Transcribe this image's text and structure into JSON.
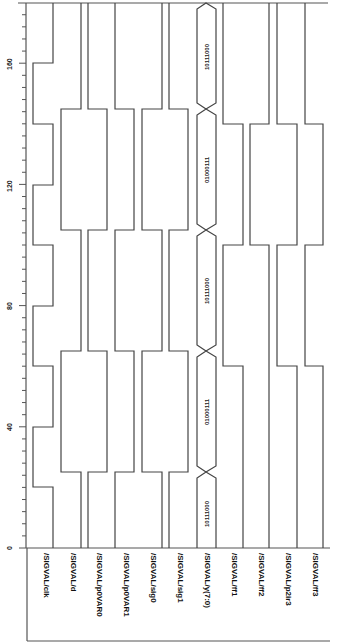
{
  "chart_data": {
    "type": "timing-diagram",
    "orientation": "rotated-90 (time runs bottom to top, signals left to right)",
    "time_axis": {
      "min": 0,
      "max": 180,
      "major_ticks": [
        0,
        40,
        80,
        120,
        160
      ],
      "minor_step": 4
    },
    "signals": [
      {
        "name": "/SIGVAL/clk",
        "type": "bit",
        "transitions": [
          [
            0,
            0
          ],
          [
            20,
            1
          ],
          [
            40,
            0
          ],
          [
            60,
            1
          ],
          [
            80,
            0
          ],
          [
            100,
            1
          ],
          [
            120,
            0
          ],
          [
            140,
            1
          ],
          [
            160,
            0
          ]
        ]
      },
      {
        "name": "/SIGVAL/d",
        "type": "bit",
        "transitions": [
          [
            0,
            0
          ],
          [
            25,
            1
          ],
          [
            65,
            0
          ],
          [
            105,
            1
          ],
          [
            145,
            0
          ]
        ]
      },
      {
        "name": "/SIGVAL/p0VAR0",
        "type": "bit",
        "transitions": [
          [
            0,
            0
          ],
          [
            25,
            1
          ],
          [
            65,
            0
          ],
          [
            105,
            1
          ],
          [
            145,
            0
          ]
        ]
      },
      {
        "name": "/SIGVAL/p0VAR1",
        "type": "bit",
        "transitions": [
          [
            0,
            0
          ],
          [
            25,
            1
          ],
          [
            65,
            0
          ],
          [
            105,
            1
          ],
          [
            145,
            0
          ]
        ]
      },
      {
        "name": "/SIGVAL/sig0",
        "type": "bit",
        "transitions": [
          [
            0,
            1
          ],
          [
            25,
            0
          ],
          [
            65,
            1
          ],
          [
            105,
            0
          ],
          [
            145,
            1
          ]
        ]
      },
      {
        "name": "/SIGVAL/sig1",
        "type": "bit",
        "transitions": [
          [
            0,
            0
          ],
          [
            25,
            1
          ],
          [
            65,
            0
          ],
          [
            105,
            1
          ],
          [
            145,
            0
          ]
        ]
      },
      {
        "name": "/SIGVAL/y(7:0)",
        "type": "bus",
        "segments": [
          {
            "start": 0,
            "end": 25,
            "value": "10111000"
          },
          {
            "start": 25,
            "end": 65,
            "value": "01000111"
          },
          {
            "start": 65,
            "end": 105,
            "value": "10111000"
          },
          {
            "start": 105,
            "end": 145,
            "value": "01000111"
          },
          {
            "start": 145,
            "end": 180,
            "value": "10111000"
          }
        ]
      },
      {
        "name": "/SIGVAL/ff1",
        "type": "bit",
        "transitions": [
          [
            0,
            0
          ],
          [
            60,
            1
          ],
          [
            100,
            0
          ],
          [
            140,
            1
          ]
        ]
      },
      {
        "name": "/SIGVAL/ff2",
        "type": "bit",
        "transitions": [
          [
            0,
            0
          ],
          [
            100,
            1
          ],
          [
            140,
            0
          ]
        ]
      },
      {
        "name": "/SIGVAL/p2ir3",
        "type": "bit",
        "transitions": [
          [
            0,
            0
          ],
          [
            60,
            1
          ],
          [
            100,
            0
          ],
          [
            140,
            1
          ]
        ]
      },
      {
        "name": "/SIGVAL/ff3",
        "type": "bit",
        "transitions": [
          [
            0,
            0
          ],
          [
            60,
            1
          ],
          [
            100,
            0
          ],
          [
            140,
            1
          ]
        ]
      }
    ]
  },
  "axis": {
    "tick_labels": [
      "0",
      "40",
      "80",
      "120",
      "160"
    ]
  },
  "labels": {
    "clk": "/SIGVAL/clk",
    "d": "/SIGVAL/d",
    "p0VAR0": "/SIGVAL/p0VAR0",
    "p0VAR1": "/SIGVAL/p0VAR1",
    "sig0": "/SIGVAL/sig0",
    "sig1": "/SIGVAL/sig1",
    "y": "/SIGVAL/y(7:0)",
    "ff1": "/SIGVAL/ff1",
    "ff2": "/SIGVAL/ff2",
    "p2ir3": "/SIGVAL/p2ir3",
    "ff3": "/SIGVAL/ff3"
  },
  "bus_values": [
    "10111000",
    "01000111",
    "10111000",
    "01000111",
    "10111000"
  ]
}
